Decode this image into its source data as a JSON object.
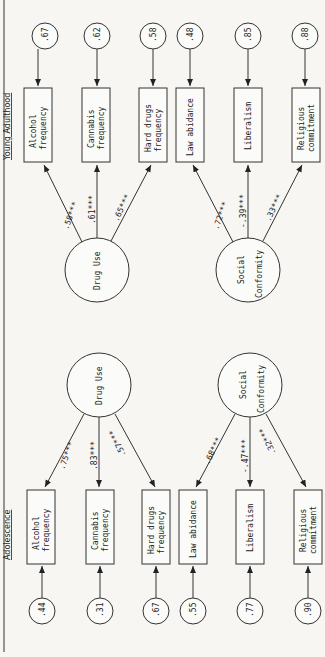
{
  "diagram": {
    "type": "structural-equation-model",
    "orientation": "rotated-90-ccw",
    "sections": [
      {
        "title": "Young Adulthood",
        "latents": [
          {
            "name": "Drug Use",
            "indicators": [
              {
                "label_l1": "Alcohol",
                "label_l2": "frequency",
                "loading": ".58***",
                "error": ".67"
              },
              {
                "label_l1": "Cannabis",
                "label_l2": "frequency",
                "loading": ".61***",
                "error": ".62"
              },
              {
                "label_l1": "Hard drugs",
                "label_l2": "frequency",
                "loading": ".65***",
                "error": ".58"
              }
            ]
          },
          {
            "name_l1": "Social",
            "name_l2": "Conformity",
            "indicators": [
              {
                "label_l1": "Law abidance",
                "label_l2": "",
                "loading": ".72***",
                "error": ".48"
              },
              {
                "label_l1": "Liberalism",
                "label_l2": "",
                "loading": "-.39***",
                "error": ".85"
              },
              {
                "label_l1": "Religious",
                "label_l2": "commitment",
                "loading": ".33***",
                "error": ".88"
              }
            ]
          }
        ]
      },
      {
        "title": "Adolescence",
        "latents": [
          {
            "name": "Drug Use",
            "indicators": [
              {
                "label_l1": "Alcohol",
                "label_l2": "frequency",
                "loading": ".75***",
                "error": ".44"
              },
              {
                "label_l1": "Cannabis",
                "label_l2": "frequency",
                "loading": ".83***",
                "error": ".31"
              },
              {
                "label_l1": "Hard drugs",
                "label_l2": "frequency",
                "loading": ".57***",
                "error": ".67"
              }
            ]
          },
          {
            "name_l1": "Social",
            "name_l2": "Conformity",
            "indicators": [
              {
                "label_l1": "Law abidance",
                "label_l2": "",
                "loading": ".68***",
                "error": ".55"
              },
              {
                "label_l1": "Liberalism",
                "label_l2": "",
                "loading": "-.47***",
                "error": ".77"
              },
              {
                "label_l1": "Religious",
                "label_l2": "commitment",
                "loading": ".32***",
                "error": ".90"
              }
            ]
          }
        ]
      }
    ]
  }
}
